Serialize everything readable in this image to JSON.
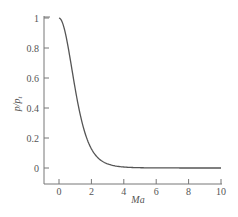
{
  "chart_data": {
    "type": "line",
    "title": "",
    "xlabel": "Ma",
    "ylabel": "p/p_t",
    "xlim": [
      -1,
      10
    ],
    "ylim": [
      -0.1,
      1.05
    ],
    "grid": false,
    "legend": null,
    "x_ticks": [
      "0",
      "2",
      "4",
      "6",
      "8",
      "10"
    ],
    "y_ticks": [
      "0",
      "0.2",
      "0.4",
      "0.6",
      "0.8",
      "1"
    ],
    "series": [
      {
        "name": "p/p_t (isentropic, gamma=1.4)",
        "x": [
          0,
          0.25,
          0.5,
          0.75,
          1.0,
          1.25,
          1.5,
          1.75,
          2.0,
          2.5,
          3.0,
          3.5,
          4.0,
          5.0,
          6.0,
          7.0,
          8.0,
          9.0,
          10.0
        ],
        "values": [
          1.0,
          0.957,
          0.843,
          0.689,
          0.528,
          0.386,
          0.272,
          0.188,
          0.128,
          0.059,
          0.027,
          0.013,
          0.0066,
          0.0019,
          0.0006,
          0.0002,
          0.0001,
          4e-05,
          2e-05
        ]
      }
    ]
  },
  "labels": {
    "x_axis": "Ma",
    "y_axis_main": "p",
    "y_axis_sub": "t"
  }
}
